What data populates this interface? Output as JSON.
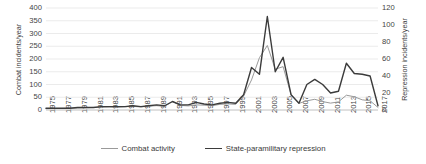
{
  "chart_data": {
    "type": "line",
    "title": "",
    "xlabel": "",
    "x": [
      1975,
      1976,
      1977,
      1978,
      1979,
      1980,
      1981,
      1982,
      1983,
      1984,
      1985,
      1986,
      1987,
      1988,
      1989,
      1990,
      1991,
      1992,
      1993,
      1994,
      1995,
      1996,
      1997,
      1998,
      1999,
      2000,
      2001,
      2002,
      2003,
      2004,
      2005,
      2006,
      2007,
      2008,
      2009,
      2010,
      2011,
      2012,
      2013,
      2014,
      2015,
      2016,
      2017
    ],
    "tick_labels": [
      "1975",
      "1977",
      "1979",
      "1981",
      "1983",
      "1985",
      "1987",
      "1989",
      "1991",
      "1993",
      "1995",
      "1997",
      "1999",
      "2001",
      "2003",
      "2005",
      "2007",
      "2009",
      "2011",
      "2013",
      "2015",
      "2017"
    ],
    "grid": true,
    "legend_position": "bottom",
    "axes": {
      "left": {
        "label": "Combat incidents/year",
        "ticks": [
          0,
          50,
          100,
          150,
          200,
          250,
          300,
          350,
          400
        ],
        "ylim": [
          0,
          400
        ]
      },
      "right": {
        "label": "Repression incidents/year",
        "ticks": [
          0,
          20,
          40,
          60,
          80,
          100,
          120
        ],
        "ylim": [
          0,
          120
        ]
      }
    },
    "series": [
      {
        "name": "Combat activity",
        "axis": "left",
        "color": "#9a9a9a",
        "width": 1.0,
        "values": [
          5,
          6,
          6,
          7,
          8,
          9,
          10,
          11,
          12,
          11,
          13,
          14,
          12,
          15,
          17,
          14,
          33,
          18,
          16,
          20,
          19,
          17,
          22,
          24,
          22,
          55,
          118,
          205,
          253,
          160,
          170,
          60,
          26,
          36,
          42,
          33,
          27,
          32,
          58,
          52,
          40,
          36,
          10
        ]
      },
      {
        "name": "State-paramilitary repression",
        "axis": "right",
        "color": "#3b3b3b",
        "width": 1.4,
        "values": [
          2,
          2,
          2,
          2,
          3,
          3,
          3,
          4,
          4,
          4,
          4,
          5,
          4,
          5,
          6,
          5,
          10,
          6,
          6,
          9,
          7,
          6,
          8,
          9,
          8,
          18,
          50,
          42,
          110,
          45,
          62,
          18,
          8,
          30,
          36,
          30,
          20,
          22,
          55,
          43,
          42,
          40,
          5
        ]
      }
    ]
  },
  "legend": {
    "items": [
      {
        "label": "Combat activity",
        "color": "#9a9a9a",
        "width": "1.1px"
      },
      {
        "label": "State-paramilitary repression",
        "color": "#3b3b3b",
        "width": "1.6px"
      }
    ]
  }
}
